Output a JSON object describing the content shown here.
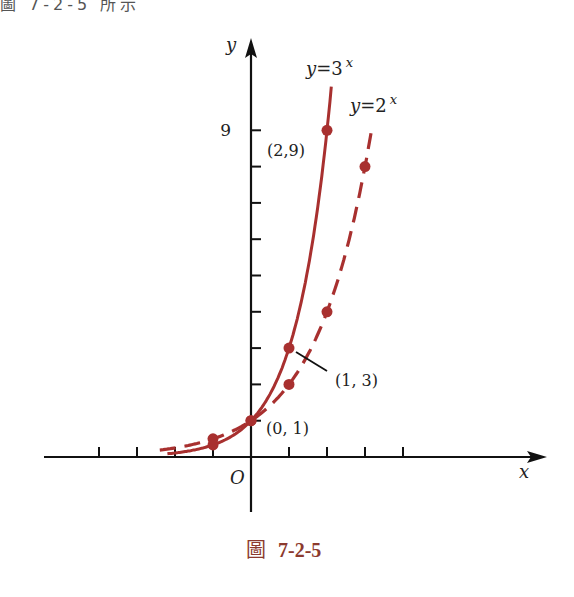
{
  "header_fragment": "圖 7-2-5 所示",
  "caption": {
    "prefix": "圖",
    "number": "7-2-5"
  },
  "colors": {
    "curve": "#a8302f",
    "axis": "#111111",
    "caption": "#8c3a2e"
  },
  "chart_data": {
    "type": "line",
    "title": "",
    "xlabel": "x",
    "ylabel": "y",
    "origin_label": "O",
    "xlim": [
      -5.5,
      7.7
    ],
    "ylim": [
      -1.5,
      10.5
    ],
    "x_ticks": [
      -4,
      -3,
      -2,
      -1,
      1,
      2,
      3,
      4
    ],
    "y_ticks": [
      1,
      2,
      3,
      4,
      5,
      6,
      7,
      8,
      9
    ],
    "y_tick_labels": [
      {
        "value": 9,
        "label": "9"
      }
    ],
    "grid": false,
    "series": [
      {
        "name": "y=3^x",
        "label": "y=3",
        "label_exp": "x",
        "style": "solid",
        "base": 3,
        "points": [
          [
            -1,
            0.333
          ],
          [
            0,
            1
          ],
          [
            1,
            3
          ],
          [
            2,
            9
          ]
        ]
      },
      {
        "name": "y=2^x",
        "label": "y=2",
        "label_exp": "x",
        "style": "dashed",
        "base": 2,
        "points": [
          [
            -1,
            0.5
          ],
          [
            0,
            1
          ],
          [
            1,
            2
          ],
          [
            2,
            4
          ],
          [
            3,
            8
          ]
        ]
      }
    ],
    "annotations": [
      {
        "text": "(2,9)",
        "x": 2,
        "y": 9
      },
      {
        "text": "(1, 3)",
        "x": 1,
        "y": 3
      },
      {
        "text": "(0, 1)",
        "x": 0,
        "y": 1
      }
    ]
  }
}
